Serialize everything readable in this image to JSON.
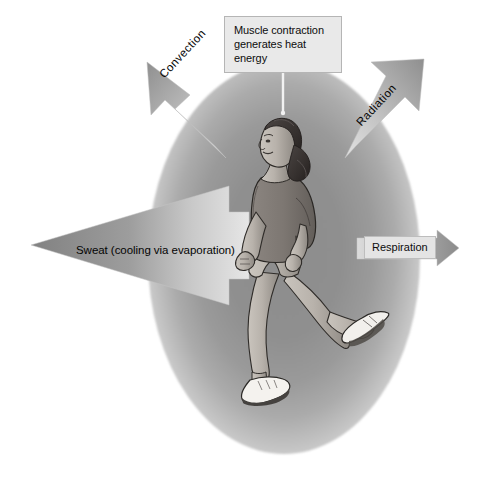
{
  "figure": {
    "background_color": "#ffffff",
    "glow_color_center": "#8e8e8e",
    "glow_color_edge": "#ffffff",
    "arrow_fill": "#8d8d8d",
    "label_box_fill": "#e9e9e9",
    "label_box_border": "#b5b5b5",
    "text_color": "#0d0d0d"
  },
  "labels": {
    "heat_source": "Muscle contraction\ngenerates heat energy",
    "heat_source_line1": "Muscle contraction",
    "heat_source_line2": "generates heat energy",
    "convection": "Convection",
    "radiation": "Radiation",
    "sweat": "Sweat (cooling via evaporation)",
    "respiration": "Respiration"
  },
  "arrows": [
    {
      "name": "convection",
      "label": "Convection",
      "direction": "up-left",
      "angle_deg": -135
    },
    {
      "name": "radiation",
      "label": "Radiation",
      "direction": "up-right",
      "angle_deg": -45
    },
    {
      "name": "sweat",
      "label": "Sweat (cooling via evaporation)",
      "direction": "left",
      "angle_deg": 180
    },
    {
      "name": "respiration",
      "label": "Respiration",
      "direction": "right",
      "angle_deg": 0
    }
  ],
  "leader_line": {
    "name": "muscle-contraction-leader",
    "from": "Muscle contraction generates heat energy",
    "to": "runner"
  }
}
